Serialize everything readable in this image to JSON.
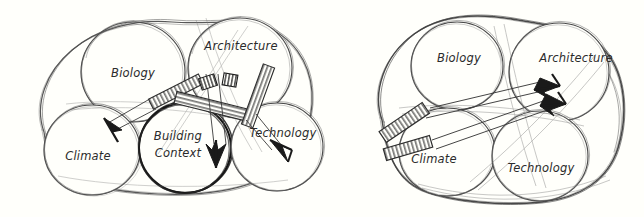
{
  "figure": {
    "background_color": "#fffffb",
    "ink_color": "#3a3a3a",
    "bold_ink_color": "#151515",
    "label_color": "#2b2b2b"
  },
  "panels": [
    {
      "id": "left",
      "name": "divergent-diagram",
      "description": "Five overlapping sketched circles inside a hand-drawn enclosing blob, with hatched ladder-shaft arrows radiating outward from the centre toward Climate, Building Context and Technology.",
      "circles": [
        {
          "id": "biology",
          "label": "Biology",
          "emphasis": "normal"
        },
        {
          "id": "architecture",
          "label": "Architecture",
          "emphasis": "normal"
        },
        {
          "id": "climate",
          "label": "Climate",
          "emphasis": "normal"
        },
        {
          "id": "building-context",
          "label_line1": "Building",
          "label_line2": "Context",
          "label": "Building Context",
          "emphasis": "bold"
        },
        {
          "id": "technology",
          "label": "Technology",
          "emphasis": "normal"
        }
      ],
      "arrows": [
        {
          "id": "arrow-to-climate",
          "from": "architecture",
          "to": "climate",
          "style": "hatched-shaft"
        },
        {
          "id": "arrow-to-building-context",
          "from": "architecture",
          "to": "building-context",
          "style": "hatched-shaft"
        },
        {
          "id": "arrow-to-technology",
          "from": "architecture",
          "to": "technology",
          "style": "hatched-shaft"
        }
      ]
    },
    {
      "id": "right",
      "name": "convergent-diagram",
      "description": "Four overlapping sketched circles inside a hand-drawn enclosing blob, with two hatched ladder-shaft arrows converging inward onto Architecture.",
      "circles": [
        {
          "id": "biology",
          "label": "Biology",
          "emphasis": "normal"
        },
        {
          "id": "architecture",
          "label": "Architecture",
          "emphasis": "normal"
        },
        {
          "id": "climate",
          "label": "Climate",
          "emphasis": "normal"
        },
        {
          "id": "technology",
          "label": "Technology",
          "emphasis": "normal"
        }
      ],
      "arrows": [
        {
          "id": "arrow-climate-to-architecture",
          "from": "climate",
          "to": "architecture",
          "style": "hatched-shaft"
        },
        {
          "id": "arrow-technology-to-architecture",
          "from": "technology",
          "to": "architecture",
          "style": "hatched-shaft"
        }
      ]
    }
  ]
}
